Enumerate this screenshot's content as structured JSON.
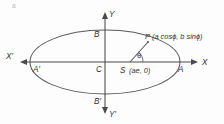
{
  "figure": {
    "title_mark": "a",
    "type": "ellipse-eccentric-angle-diagram",
    "background_color": "#fdfdfd",
    "stroke_color": "#5a5a5a",
    "label_color": "#333333",
    "axes": {
      "x_positive": "X",
      "x_negative": "X′",
      "y_positive": "Y",
      "y_negative": "Y′"
    },
    "points": {
      "center": "C",
      "vertex_right": "A",
      "vertex_left": "A′",
      "covertex_top": "B",
      "covertex_bottom": "B′",
      "focus": "S",
      "focus_coords": "(ae, 0)",
      "point_on_ellipse": "P",
      "point_coords": "(a cosϕ, b sinϕ)",
      "angle": "θ"
    },
    "geometry": {
      "center_x": 105,
      "center_y": 62,
      "semi_major": 75,
      "semi_minor": 32,
      "focus_x": 130,
      "focus_y": 62,
      "p_x": 148,
      "p_y": 42
    }
  }
}
